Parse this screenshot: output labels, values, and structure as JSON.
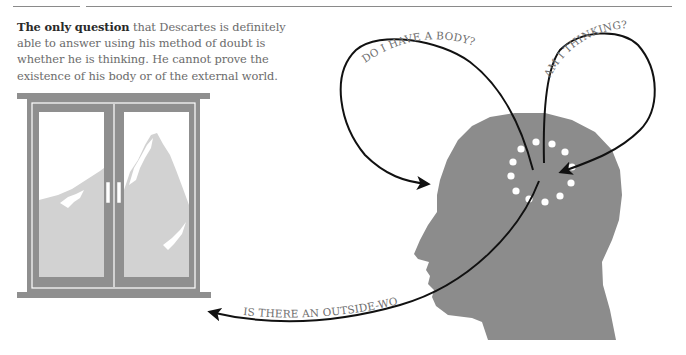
{
  "caption": {
    "lead": "The only question",
    "body": " that Descartes is definitely able to answer using his method of doubt is whether he is thinking. He cannot prove the existence of his body or of the external world."
  },
  "questions": {
    "body": "DO I HAVE A BODY?",
    "thinking": "AM I THINKING?",
    "world": "IS THERE AN OUTSIDE-WORLD?"
  },
  "colors": {
    "head": "#8c8c8c",
    "window_frame": "#8f8f8f",
    "mountain": "#d2d2d2",
    "arrow": "#111111",
    "dots": "#ffffff"
  }
}
